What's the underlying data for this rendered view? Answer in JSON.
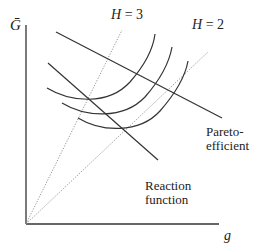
{
  "diagram": {
    "y_axis_label": "Ḡ",
    "x_axis_label": "g",
    "rays": [
      {
        "name": "H = 3",
        "label": "H = 3"
      },
      {
        "name": "H = 2",
        "label": "H = 2"
      }
    ],
    "lines": [
      {
        "name": "pareto-efficient",
        "label_line1": "Pareto-",
        "label_line2": "efficient"
      },
      {
        "name": "reaction-function",
        "label_line1": "Reaction",
        "label_line2": "function"
      }
    ],
    "indifference_curves_count": 3,
    "colors": {
      "ink": "#222222",
      "ray": "#888888"
    }
  }
}
